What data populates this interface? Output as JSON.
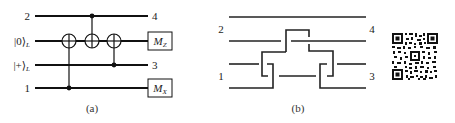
{
  "panel_a": {
    "caption": "(a)",
    "wires": [
      {
        "left_label": "2",
        "right_label": "4"
      },
      {
        "left_label": "|0⟩",
        "left_sub": "L",
        "right_box": "M",
        "right_box_sub": "Z"
      },
      {
        "left_label": "|+⟩",
        "left_sub": "L",
        "right_label": "3"
      },
      {
        "left_label": "1",
        "right_box": "M",
        "right_box_sub": "X"
      }
    ],
    "gates": [
      {
        "type": "CNOT",
        "control_wire": 3,
        "target_wire": 1
      },
      {
        "type": "CNOT",
        "control_wire": 0,
        "target_wire": 1
      },
      {
        "type": "CNOT",
        "control_wire": 2,
        "target_wire": 1
      }
    ]
  },
  "panel_b": {
    "caption": "(b)",
    "labels": {
      "top_left": "2",
      "top_right": "4",
      "bottom_left": "1",
      "bottom_right": "3"
    }
  },
  "qr_code": {
    "present": true
  }
}
